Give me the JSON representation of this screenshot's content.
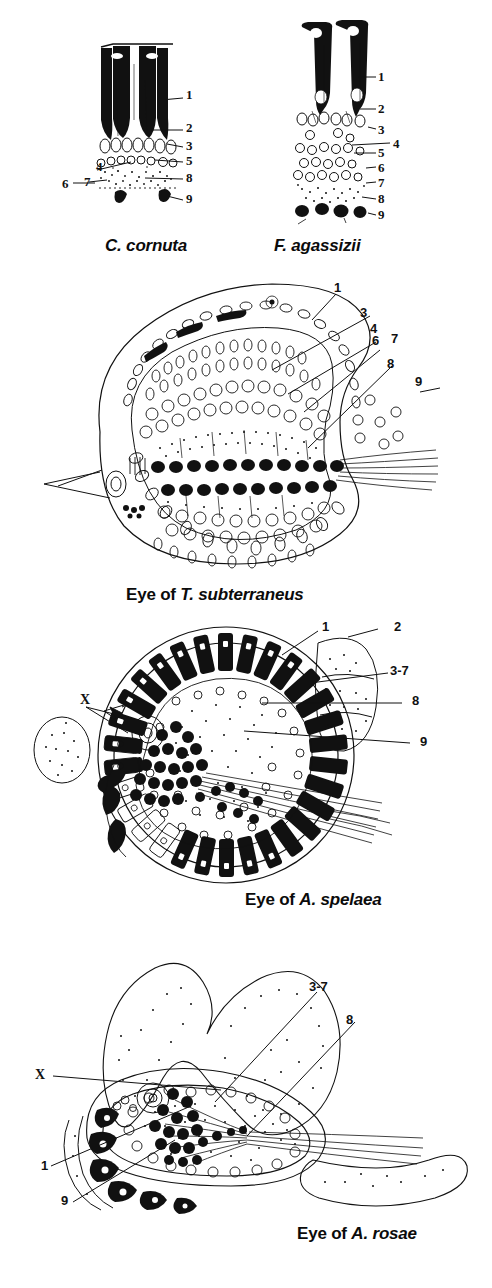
{
  "figure": {
    "background": "#ffffff",
    "ink": "#111111",
    "width": 492,
    "height": 1288
  },
  "panels": [
    {
      "id": "c-cornuta",
      "caption_prefix": "",
      "caption_species": "C. cornuta",
      "caption_style": "species-only",
      "labels": [
        {
          "key": "1",
          "text": "1",
          "x": 186,
          "y": 95
        },
        {
          "key": "2",
          "text": "2",
          "x": 186,
          "y": 128
        },
        {
          "key": "3",
          "text": "3",
          "x": 186,
          "y": 146
        },
        {
          "key": "5",
          "text": "5",
          "x": 186,
          "y": 161
        },
        {
          "key": "8",
          "text": "8",
          "x": 186,
          "y": 178
        },
        {
          "key": "9",
          "text": "9",
          "x": 186,
          "y": 199
        },
        {
          "key": "4",
          "text": "4",
          "x": 96,
          "y": 167
        },
        {
          "key": "6",
          "text": "6",
          "x": 62,
          "y": 184
        },
        {
          "key": "7",
          "text": "7",
          "x": 84,
          "y": 182
        }
      ]
    },
    {
      "id": "f-agassizii",
      "caption_prefix": "",
      "caption_species": "F. agassizii",
      "caption_style": "species-only",
      "labels": [
        {
          "key": "1",
          "text": "1",
          "x": 372,
          "y": 77
        },
        {
          "key": "2",
          "text": "2",
          "x": 372,
          "y": 109
        },
        {
          "key": "3",
          "text": "3",
          "x": 372,
          "y": 130
        },
        {
          "key": "4",
          "text": "4",
          "x": 392,
          "y": 145
        },
        {
          "key": "5",
          "text": "5",
          "x": 372,
          "y": 153
        },
        {
          "key": "6",
          "text": "6",
          "x": 372,
          "y": 168
        },
        {
          "key": "7",
          "text": "7",
          "x": 372,
          "y": 183
        },
        {
          "key": "8",
          "text": "8",
          "x": 372,
          "y": 199
        },
        {
          "key": "9",
          "text": "9",
          "x": 372,
          "y": 215
        }
      ]
    },
    {
      "id": "t-subterraneus",
      "caption_prefix": "Eye of ",
      "caption_species": "T. subterraneus",
      "caption_style": "eye-of",
      "labels": [
        {
          "key": "1",
          "text": "1",
          "x": 333,
          "y": 287
        },
        {
          "key": "3",
          "text": "3",
          "x": 360,
          "y": 312
        },
        {
          "key": "4",
          "text": "4",
          "x": 370,
          "y": 328
        },
        {
          "key": "6",
          "text": "6",
          "x": 372,
          "y": 340
        },
        {
          "key": "7",
          "text": "7",
          "x": 390,
          "y": 338
        },
        {
          "key": "8",
          "text": "8",
          "x": 387,
          "y": 363
        },
        {
          "key": "9",
          "text": "9",
          "x": 414,
          "y": 381
        }
      ]
    },
    {
      "id": "a-spelaea",
      "caption_prefix": "Eye of ",
      "caption_species": "A. spelaea",
      "caption_style": "eye-of",
      "labels": [
        {
          "key": "1",
          "text": "1",
          "x": 322,
          "y": 627
        },
        {
          "key": "2",
          "text": "2",
          "x": 394,
          "y": 628
        },
        {
          "key": "3-7",
          "text": "3-7",
          "x": 395,
          "y": 671
        },
        {
          "key": "8",
          "text": "8",
          "x": 412,
          "y": 701
        },
        {
          "key": "9",
          "text": "9",
          "x": 420,
          "y": 742
        },
        {
          "key": "X",
          "text": "X",
          "x": 80,
          "y": 700
        }
      ]
    },
    {
      "id": "a-rosae",
      "caption_prefix": "Eye of ",
      "caption_species": "A. rosae",
      "caption_style": "eye-of",
      "labels": [
        {
          "key": "3-7",
          "text": "3-7",
          "x": 312,
          "y": 987
        },
        {
          "key": "8",
          "text": "8",
          "x": 346,
          "y": 1020
        },
        {
          "key": "X",
          "text": "X",
          "x": 35,
          "y": 1075
        },
        {
          "key": "1",
          "text": "1",
          "x": 41,
          "y": 1166
        },
        {
          "key": "9",
          "text": "9",
          "x": 61,
          "y": 1201
        }
      ]
    }
  ],
  "captions": {
    "c_cornuta": {
      "prefix": "",
      "species": "C. cornuta"
    },
    "f_agassizii": {
      "prefix": "",
      "species": "F. agassizii"
    },
    "t_subterraneus": {
      "prefix": "Eye of ",
      "species": "T. subterraneus"
    },
    "a_spelaea": {
      "prefix": "Eye of ",
      "species": "A. spelaea"
    },
    "a_rosae": {
      "prefix": "Eye of ",
      "species": "A. rosae"
    }
  }
}
